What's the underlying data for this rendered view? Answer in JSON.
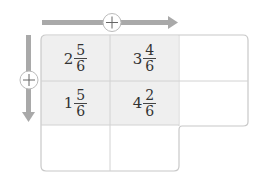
{
  "operator": "+",
  "colors": {
    "arrow": "#a9a9a9",
    "shaded": "#efefef",
    "border": "#c8c8c8"
  },
  "cells": [
    {
      "whole": "2",
      "num": "5",
      "den": "6"
    },
    {
      "whole": "3",
      "num": "4",
      "den": "6"
    },
    {
      "whole": "1",
      "num": "5",
      "den": "6"
    },
    {
      "whole": "4",
      "num": "2",
      "den": "6"
    }
  ],
  "blanks": {
    "right_col": [
      "",
      ""
    ],
    "bottom_row": [
      "",
      ""
    ]
  }
}
